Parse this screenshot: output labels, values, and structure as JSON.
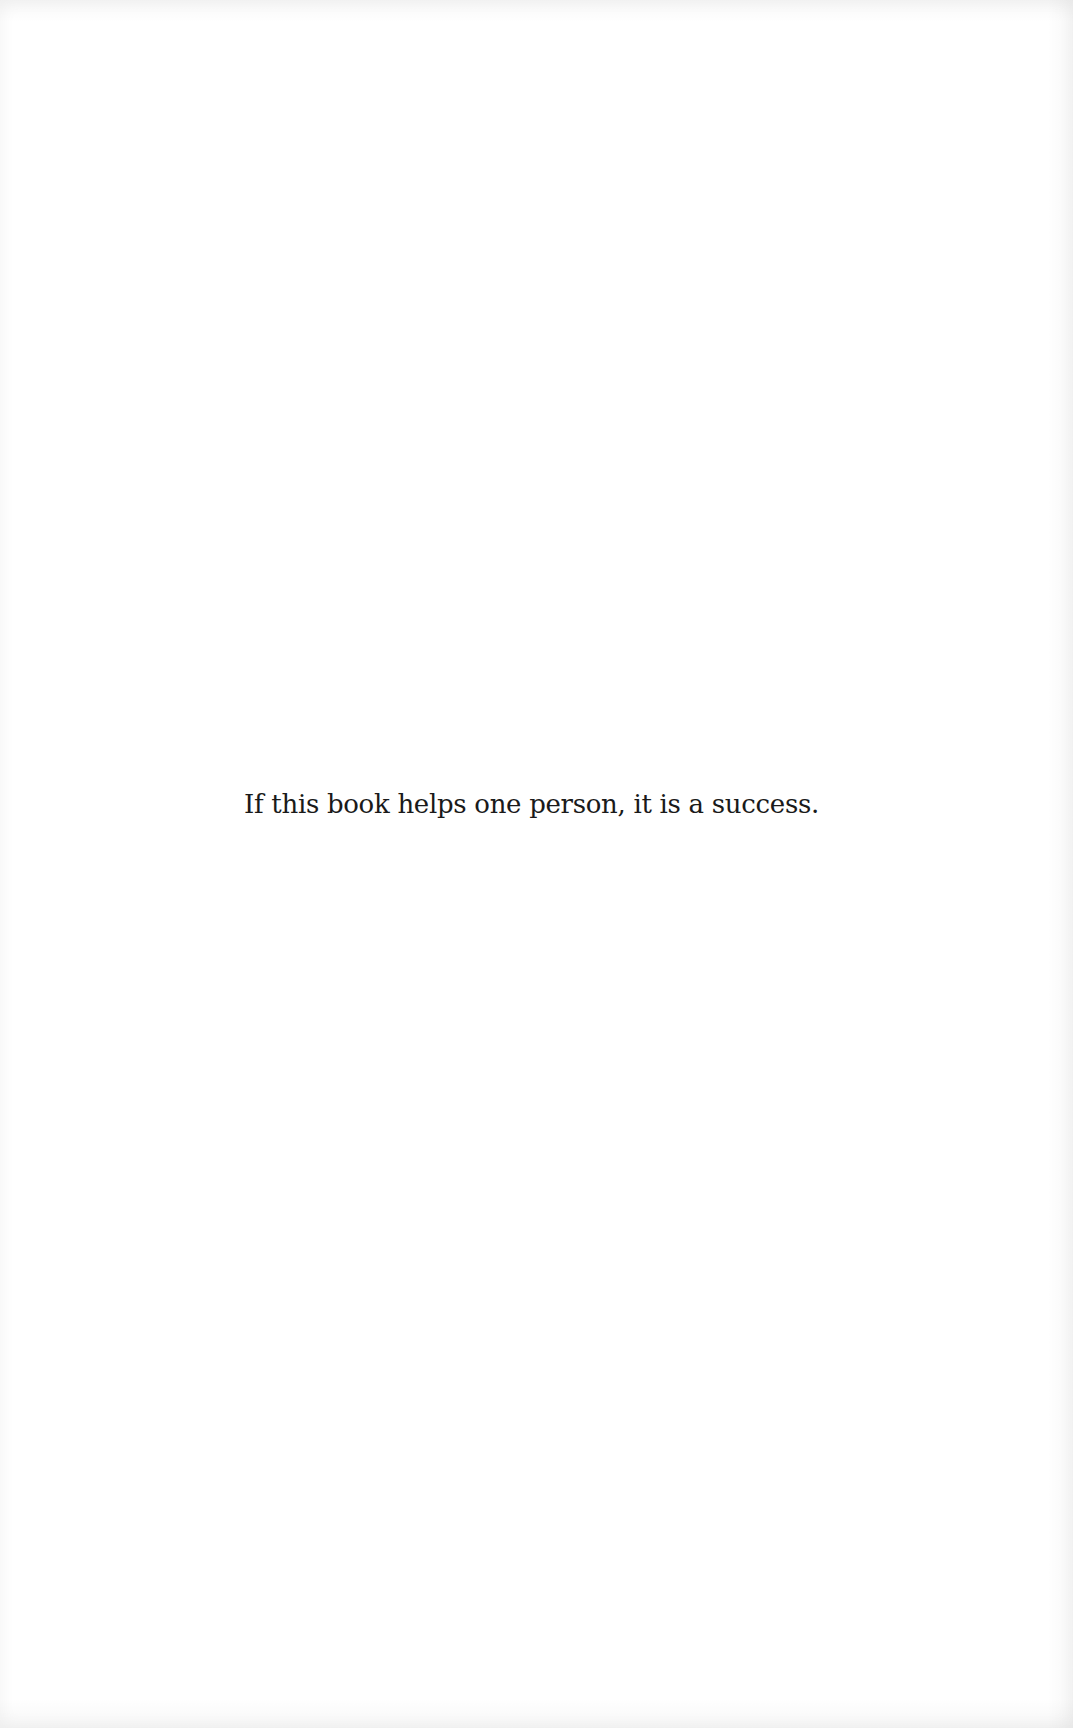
{
  "page": {
    "background_color": "#ffffff",
    "text_color": "#1a1a1a",
    "epigraph": "If this book helps one person, it is a success."
  }
}
